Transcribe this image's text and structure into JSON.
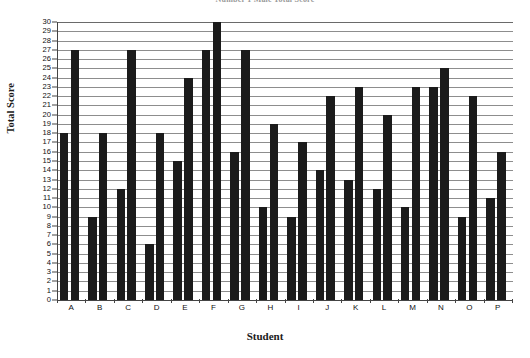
{
  "chart_data": {
    "type": "bar",
    "title": "Number 1 Male Total Score",
    "xlabel": "Student",
    "ylabel": "Total Score",
    "ylim": [
      0,
      30
    ],
    "ytick_step": 1,
    "grid": true,
    "legend": null,
    "categories": [
      "A",
      "B",
      "C",
      "D",
      "E",
      "F",
      "G",
      "H",
      "I",
      "J",
      "K",
      "L",
      "M",
      "N",
      "O",
      "P"
    ],
    "series": [
      {
        "name": "Bar 1",
        "values": [
          18,
          9,
          12,
          6,
          15,
          27,
          16,
          10,
          9,
          14,
          13,
          12,
          10,
          23,
          9,
          11
        ]
      },
      {
        "name": "Bar 2",
        "values": [
          27,
          18,
          27,
          18,
          24,
          30,
          27,
          19,
          17,
          22,
          23,
          20,
          23,
          25,
          22,
          16
        ]
      }
    ],
    "ytick_labels": [
      "0",
      "1",
      "2",
      "3",
      "4",
      "5",
      "6",
      "7",
      "8",
      "9",
      "10",
      "11",
      "12",
      "13",
      "14",
      "15",
      "16",
      "17",
      "18",
      "19",
      "20",
      "21",
      "22",
      "23",
      "24",
      "25",
      "26",
      "27",
      "28",
      "29",
      "30"
    ],
    "bar_color": "#1b1b1b",
    "grid_color": "#8d8d8d",
    "axis_color": "#444444"
  }
}
